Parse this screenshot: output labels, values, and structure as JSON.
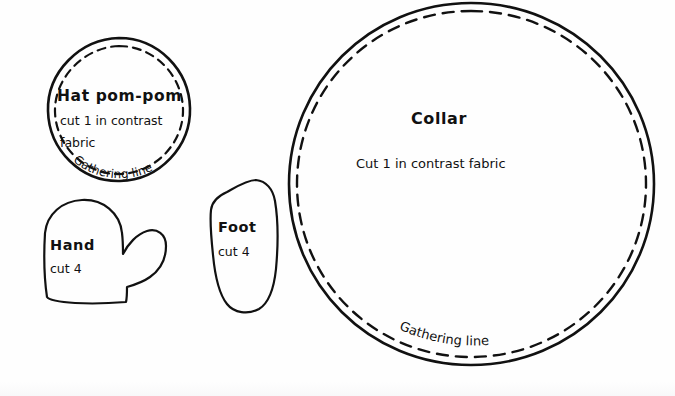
{
  "document": {
    "type": "sewing-pattern-sheet",
    "background_color": "#fefefe",
    "ink_color": "#111111",
    "width": 675,
    "height": 396
  },
  "pieces": {
    "hat_pompom": {
      "title": "Hat pom-pom",
      "instruction_line1": "cut 1 in contrast",
      "instruction_line2": "fabric",
      "gathering_label": "Gathering line",
      "shape": "circle",
      "has_dashed_gathering_circle": true
    },
    "collar": {
      "title": "Collar",
      "instruction_line1": "Cut 1 in contrast fabric",
      "gathering_label": "Gathering line",
      "shape": "circle",
      "has_dashed_gathering_circle": true
    },
    "hand": {
      "title": "Hand",
      "instruction_line1": "cut 4",
      "shape": "mitten"
    },
    "foot": {
      "title": "Foot",
      "instruction_line1": "cut 4",
      "shape": "wedge"
    }
  }
}
